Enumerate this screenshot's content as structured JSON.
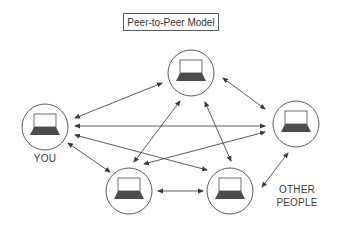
{
  "title": "Peer-to-Peer Model",
  "labels": {
    "you": "YOU",
    "other_line1": "OTHER",
    "other_line2": "PEOPLE"
  },
  "colors": {
    "stroke": "#4a4a4a",
    "laptop_base": "#4d4d4d",
    "background": "#ffffff"
  },
  "nodes": [
    {
      "id": "you",
      "cx": 45,
      "cy": 127,
      "r": 23
    },
    {
      "id": "top",
      "cx": 191,
      "cy": 73,
      "r": 23
    },
    {
      "id": "right",
      "cx": 296,
      "cy": 124,
      "r": 23
    },
    {
      "id": "bottom-left",
      "cx": 129,
      "cy": 191,
      "r": 23
    },
    {
      "id": "bottom-right",
      "cx": 230,
      "cy": 191,
      "r": 23
    }
  ],
  "connections": [
    {
      "from": "you",
      "to": "top",
      "x1": 75,
      "y1": 118,
      "x2": 162,
      "y2": 83
    },
    {
      "from": "you",
      "to": "right",
      "x1": 75,
      "y1": 126,
      "x2": 265,
      "y2": 126
    },
    {
      "from": "you",
      "to": "bottom-right",
      "x1": 75,
      "y1": 135,
      "x2": 207,
      "y2": 170
    },
    {
      "from": "you",
      "to": "bottom-left",
      "x1": 68,
      "y1": 143,
      "x2": 110,
      "y2": 172
    },
    {
      "from": "top",
      "to": "right",
      "x1": 223,
      "y1": 78,
      "x2": 265,
      "y2": 109
    },
    {
      "from": "top",
      "to": "bottom-left",
      "x1": 180,
      "y1": 101,
      "x2": 134,
      "y2": 162
    },
    {
      "from": "top",
      "to": "bottom-right",
      "x1": 205,
      "y1": 102,
      "x2": 231,
      "y2": 161
    },
    {
      "from": "right",
      "to": "bottom-left",
      "x1": 265,
      "y1": 132,
      "x2": 144,
      "y2": 164
    },
    {
      "from": "right",
      "to": "bottom-right",
      "x1": 288,
      "y1": 153,
      "x2": 262,
      "y2": 187
    },
    {
      "from": "bottom-left",
      "to": "bottom-right",
      "x1": 158,
      "y1": 191,
      "x2": 203,
      "y2": 191
    }
  ]
}
